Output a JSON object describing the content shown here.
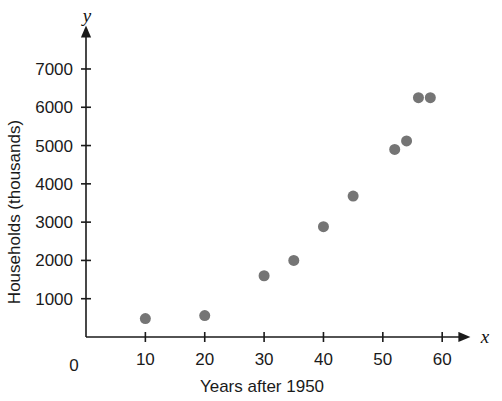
{
  "chart_data": {
    "type": "scatter",
    "title": "",
    "xlabel": "Years after 1950",
    "ylabel": "Households (thousands)",
    "x_axis_variable": "x",
    "y_axis_variable": "y",
    "origin_label": "0",
    "xlim": [
      0,
      63
    ],
    "ylim": [
      0,
      7600
    ],
    "xticks": [
      10,
      20,
      30,
      40,
      50,
      60
    ],
    "xtick_labels": [
      "10",
      "20",
      "30",
      "40",
      "50",
      "60"
    ],
    "yticks": [
      1000,
      2000,
      3000,
      4000,
      5000,
      6000,
      7000
    ],
    "ytick_labels": [
      "1000",
      "2000",
      "3000",
      "4000",
      "5000",
      "6000",
      "7000"
    ],
    "grid": false,
    "legend": false,
    "marker_color": "#757575",
    "marker_radius": 5.5,
    "axis_color": "#1a1a1a",
    "points": [
      {
        "x": 10,
        "y": 480
      },
      {
        "x": 20,
        "y": 560
      },
      {
        "x": 30,
        "y": 1600
      },
      {
        "x": 35,
        "y": 2000
      },
      {
        "x": 40,
        "y": 2880
      },
      {
        "x": 45,
        "y": 3680
      },
      {
        "x": 52,
        "y": 4900
      },
      {
        "x": 54,
        "y": 5120
      },
      {
        "x": 56,
        "y": 6250
      },
      {
        "x": 58,
        "y": 6250
      }
    ]
  }
}
